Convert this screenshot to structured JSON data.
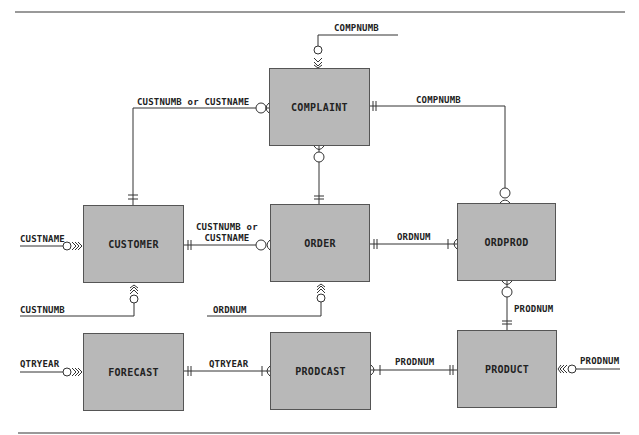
{
  "entities": {
    "complaint": {
      "label": "COMPLAINT",
      "x": 269,
      "y": 68,
      "w": 101,
      "h": 78
    },
    "customer": {
      "label": "CUSTOMER",
      "x": 83,
      "y": 205,
      "w": 101,
      "h": 78
    },
    "order": {
      "label": "ORDER",
      "x": 270,
      "y": 204,
      "w": 100,
      "h": 78
    },
    "ordprod": {
      "label": "ORDPROD",
      "x": 457,
      "y": 203,
      "w": 99,
      "h": 78
    },
    "forecast": {
      "label": "FORECAST",
      "x": 83,
      "y": 333,
      "w": 101,
      "h": 78
    },
    "prodcast": {
      "label": "PRODCAST",
      "x": 270,
      "y": 332,
      "w": 101,
      "h": 78
    },
    "product": {
      "label": "PRODUCT",
      "x": 457,
      "y": 330,
      "w": 100,
      "h": 78
    }
  },
  "labels": {
    "complaint_compnumb_key": "COMPNUMB",
    "customer_complaint": "CUSTNUMB or CUSTNAME",
    "complaint_ordprod": "COMPNUMB",
    "customer_custname_key": "CUSTNAME",
    "customer_order_line1": "CUSTNUMB or",
    "customer_order_line2": "CUSTNAME",
    "order_ordprod": "ORDNUM",
    "customer_custnumb_key": "CUSTNUMB",
    "order_ordnum_key": "ORDNUM",
    "ordprod_product": "PRODNUM",
    "forecast_qtryear_key": "QTRYEAR",
    "forecast_prodcast": "QTRYEAR",
    "prodcast_product": "PRODNUM",
    "product_prodnum_key": "PRODNUM"
  },
  "colors": {
    "entity_fill": "#b8b8b8",
    "line": "#333333",
    "rule": "#777777"
  }
}
